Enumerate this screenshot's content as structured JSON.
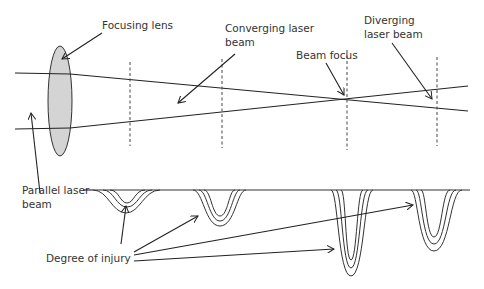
{
  "labels": {
    "focusing_lens": "Focusing lens",
    "converging_1": "Converging laser",
    "converging_2": "beam",
    "diverging_1": "Diverging",
    "diverging_2": "laser beam",
    "beam_focus": "Beam focus",
    "parallel_1": "Parallel laser",
    "parallel_2": "beam",
    "degree_of_injury": "Degree of injury"
  },
  "colors": {
    "lens_fill": "#d4d4d4",
    "line": "#222222",
    "text": "#333333"
  }
}
